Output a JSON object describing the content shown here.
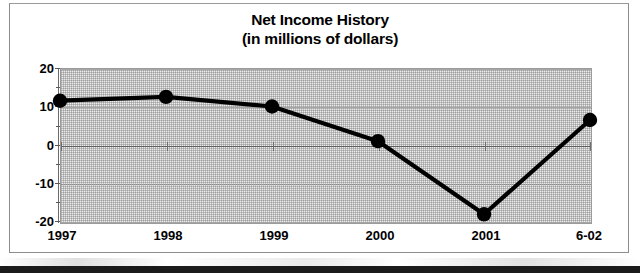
{
  "chart_data": {
    "type": "line",
    "title": "Net Income History",
    "subtitle": "(in millions of dollars)",
    "xlabel": "",
    "ylabel": "",
    "categories": [
      "1997",
      "1998",
      "1999",
      "2000",
      "2001",
      "6-02"
    ],
    "values": [
      11.5,
      12.5,
      10,
      1,
      -18,
      6.5
    ],
    "series": [
      {
        "name": "Net Income",
        "values": [
          11.5,
          12.5,
          10,
          1,
          -18,
          6.5
        ]
      }
    ],
    "ylim": [
      -20,
      20
    ],
    "ytick_labels": [
      "20",
      "10",
      "0",
      "-10",
      "-20"
    ],
    "ytick_values": [
      20,
      10,
      0,
      -10,
      -20
    ],
    "grid": true,
    "legend": "none",
    "marker": "filled-circle",
    "line_color": "#000000",
    "marker_color": "#000000",
    "plot_background": "#ececec",
    "gridline_color": "#a6a6a6",
    "zero_line_color": "#5e5e5e"
  },
  "axis": {
    "y_labels": [
      {
        "text": "20",
        "value": 20
      },
      {
        "text": "10",
        "value": 10
      },
      {
        "text": "0",
        "value": 0
      },
      {
        "text": "-10",
        "value": -10
      },
      {
        "text": "-20",
        "value": -20
      }
    ],
    "x_labels": [
      {
        "text": "1997"
      },
      {
        "text": "1998"
      },
      {
        "text": "1999"
      },
      {
        "text": "2000"
      },
      {
        "text": "2001"
      },
      {
        "text": "6-02"
      }
    ]
  }
}
